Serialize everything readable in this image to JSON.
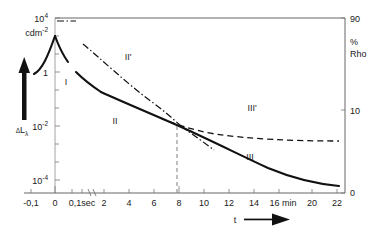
{
  "chart_data": {
    "type": "line",
    "title": "",
    "xlabel": "t",
    "ylabel_left": "ΔL",
    "ylabel_left_sub": "λ",
    "ylabel_left_unit_mantissa": "cdm",
    "ylabel_left_unit_exp": "-2",
    "ylabel_right_line1": "%",
    "ylabel_right_line2": "Rho",
    "grid": false,
    "legend": "none",
    "x_axis": {
      "broken": true,
      "break_after_label": "0,1sec",
      "tick_labels": [
        "-0,1",
        "0",
        "0,1sec",
        "2",
        "4",
        "6",
        "8",
        "10",
        "12",
        "14",
        "16 min",
        "20",
        "22"
      ],
      "unit_note": "16 min",
      "arrow": true
    },
    "y_axis_left": {
      "scale": "log",
      "tick_labels": [
        "10",
        "1",
        "10",
        "10"
      ],
      "tick_exponents": [
        "4",
        "",
        "-2",
        "-4"
      ],
      "tick_display": [
        "10^4",
        "1",
        "10^-2",
        "10^-4"
      ],
      "range": "10^-5 to 10^5"
    },
    "y_axis_right": {
      "scale": "linear-rho",
      "tick_labels": [
        "90",
        "10",
        "0"
      ],
      "unit": "% Rho"
    },
    "region_labels": [
      {
        "text": "I",
        "x": 0.3,
        "note": "solid curve, first decay segment"
      },
      {
        "text": "II",
        "x": 3.0,
        "note": "solid curve, second decay segment"
      },
      {
        "text": "II'",
        "x": 5.0,
        "note": "dash-dot curve, second segment"
      },
      {
        "text": "III",
        "x": 14.0,
        "note": "solid curve, third decay segment"
      },
      {
        "text": "III'",
        "x": 14.5,
        "note": "dashed curve, third segment"
      }
    ],
    "series": [
      {
        "name": "solid-decay-curve",
        "style": "solid",
        "description": "Luminescence decay ΔL_lambda: rises sharply to peak at t=0 then decays through regions I, II, III"
      },
      {
        "name": "dash-dot-curve",
        "style": "dash-dot",
        "description": "Region II' auxiliary curve descending from top-left to cross solid curve near t=7.8"
      },
      {
        "name": "dashed-curve",
        "style": "dashed",
        "description": "Region III' curve levelling off near rho = 8-9%"
      },
      {
        "name": "crossing-marker",
        "style": "vertical-dashed",
        "description": "Vertical dashed drop line at t ≈ 7.8 marking the curve intersection"
      }
    ],
    "crossing_point_t": 7.8
  }
}
